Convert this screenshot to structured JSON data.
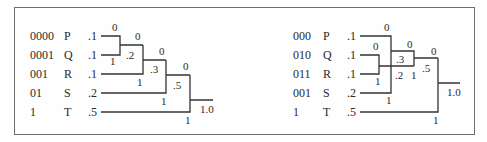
{
  "figure": {
    "left_tree": {
      "title": "Huffman tree (sequential merging)",
      "rows": [
        {
          "code": "0000",
          "symbol": "P",
          "prob": ".1"
        },
        {
          "code": "0001",
          "symbol": "Q",
          "prob": ".1"
        },
        {
          "code": "001",
          "symbol": "R",
          "prob": ".1"
        },
        {
          "code": "01",
          "symbol": "S",
          "prob": ".2"
        },
        {
          "code": "1",
          "symbol": "T",
          "prob": ".5"
        }
      ],
      "nodes": [
        {
          "sum": ".2",
          "bit0": "0",
          "bit1": "1"
        },
        {
          "sum": ".3",
          "bit0": "0",
          "bit1": "1"
        },
        {
          "sum": ".5",
          "bit0": "0",
          "bit1": "1"
        },
        {
          "sum": "1.0",
          "bit0": "0",
          "bit1": "1"
        }
      ]
    },
    "right_tree": {
      "title": "Huffman tree (alternative merging)",
      "rows": [
        {
          "code": "000",
          "symbol": "P",
          "prob": ".1"
        },
        {
          "code": "010",
          "symbol": "Q",
          "prob": ".1"
        },
        {
          "code": "011",
          "symbol": "R",
          "prob": ".1"
        },
        {
          "code": "001",
          "symbol": "S",
          "prob": ".2"
        },
        {
          "code": "1",
          "symbol": "T",
          "prob": ".5"
        }
      ],
      "nodes": [
        {
          "sum": ".2",
          "bit0": "0",
          "bit1": "1"
        },
        {
          "sum": ".3",
          "bit0": "0",
          "bit1": "1"
        },
        {
          "sum": ".5",
          "bit0": "0",
          "bit1": "1"
        },
        {
          "sum": "1.0",
          "bit0": "0",
          "bit1": "1"
        }
      ]
    }
  }
}
